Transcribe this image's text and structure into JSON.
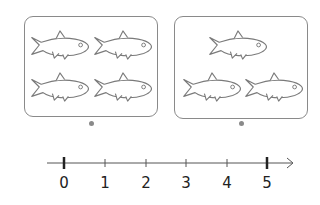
{
  "diagram": {
    "groups": [
      {
        "name": "left-group",
        "fish_count": 4,
        "arrangement": "2 rows of 2"
      },
      {
        "name": "right-group",
        "fish_count": 3,
        "arrangement": "1 on top, 2 on bottom"
      }
    ],
    "number_line": {
      "min": 0,
      "max": 5,
      "labels": [
        "0",
        "1",
        "2",
        "3",
        "4",
        "5"
      ],
      "bold_ticks": [
        "0",
        "5"
      ]
    },
    "colors": {
      "stroke": "#8a8a8a",
      "text": "#222222",
      "axis": "#555555"
    }
  }
}
